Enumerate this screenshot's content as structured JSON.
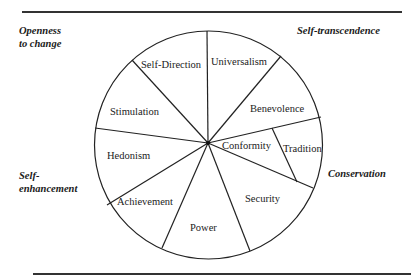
{
  "diagram": {
    "higher_order_dimensions": [
      {
        "id": "openness",
        "line1": "Openness",
        "line2": "to change"
      },
      {
        "id": "self-transcendence",
        "line1": "Self-transcendence",
        "line2": ""
      },
      {
        "id": "self-enhancement",
        "line1": "Self-",
        "line2": "enhancement"
      },
      {
        "id": "conservation",
        "line1": "Conservation",
        "line2": ""
      }
    ],
    "values": [
      {
        "label": "Universalism"
      },
      {
        "label": "Benevolence"
      },
      {
        "label": "Conformity"
      },
      {
        "label": "Tradition"
      },
      {
        "label": "Security"
      },
      {
        "label": "Power"
      },
      {
        "label": "Achievement"
      },
      {
        "label": "Hedonism"
      },
      {
        "label": "Stimulation"
      },
      {
        "label": "Self-Direction"
      }
    ],
    "line_color": "#222222",
    "background": "#ffffff"
  }
}
